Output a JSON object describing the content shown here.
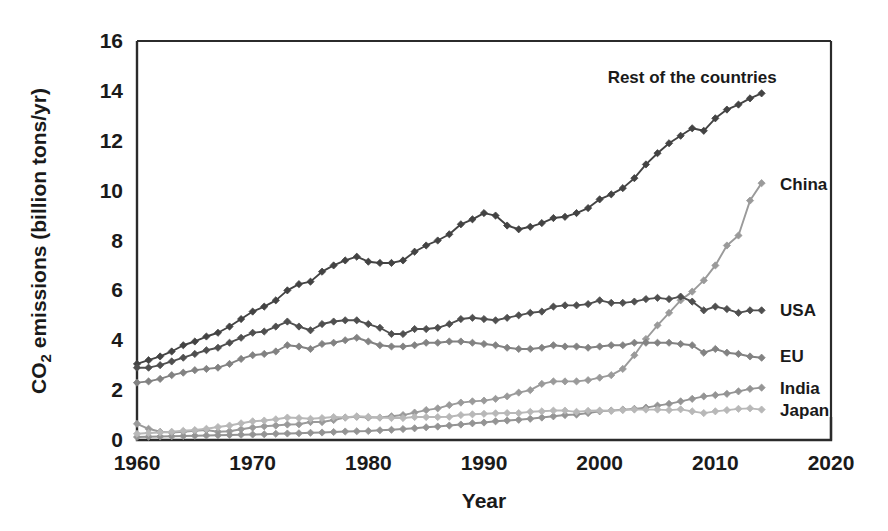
{
  "chart_data": {
    "type": "line",
    "title": "",
    "xlabel": "Year",
    "ylabel": "CO2 emissions (billion tons/yr)",
    "ylabel_parts": {
      "pre": "CO",
      "sub": "2",
      "post": " emissions (billion tons/yr)"
    },
    "xlim": [
      1960,
      2020
    ],
    "ylim": [
      0,
      16
    ],
    "xticks": [
      1960,
      1970,
      1980,
      1990,
      2000,
      2010,
      2020
    ],
    "xtick_labels": [
      "1960",
      "1970",
      "1980",
      "1990",
      "2000",
      "2010",
      "2020"
    ],
    "yticks": [
      0,
      2,
      4,
      6,
      8,
      10,
      12,
      14,
      16
    ],
    "ytick_labels": [
      "0",
      "2",
      "4",
      "6",
      "8",
      "10",
      "12",
      "14",
      "16"
    ],
    "grid": false,
    "legend_position": "right-inline-labels",
    "markers": "diamond",
    "x": [
      1960,
      1961,
      1962,
      1963,
      1964,
      1965,
      1966,
      1967,
      1968,
      1969,
      1970,
      1971,
      1972,
      1973,
      1974,
      1975,
      1976,
      1977,
      1978,
      1979,
      1980,
      1981,
      1982,
      1983,
      1984,
      1985,
      1986,
      1987,
      1988,
      1989,
      1990,
      1991,
      1992,
      1993,
      1994,
      1995,
      1996,
      1997,
      1998,
      1999,
      2000,
      2001,
      2002,
      2003,
      2004,
      2005,
      2006,
      2007,
      2008,
      2009,
      2010,
      2011,
      2012,
      2013,
      2014
    ],
    "series": [
      {
        "name": "Rest of the countries",
        "color": "#434343",
        "label_x": 2008,
        "label_y": 14.55,
        "label_anchor": "middle",
        "values": [
          3.05,
          3.2,
          3.35,
          3.55,
          3.8,
          3.95,
          4.15,
          4.3,
          4.55,
          4.85,
          5.15,
          5.35,
          5.6,
          6.0,
          6.25,
          6.35,
          6.75,
          7.0,
          7.2,
          7.35,
          7.15,
          7.1,
          7.1,
          7.2,
          7.55,
          7.8,
          8.0,
          8.25,
          8.65,
          8.85,
          9.1,
          9.0,
          8.6,
          8.45,
          8.55,
          8.7,
          8.9,
          8.95,
          9.1,
          9.3,
          9.65,
          9.85,
          10.1,
          10.5,
          11.05,
          11.5,
          11.9,
          12.2,
          12.5,
          12.4,
          12.9,
          13.25,
          13.45,
          13.7,
          13.9
        ]
      },
      {
        "name": "China",
        "color": "#9a9a9a",
        "label_x": 2015.6,
        "label_y": 10.25,
        "label_anchor": "start",
        "values": [
          0.65,
          0.45,
          0.33,
          0.3,
          0.33,
          0.37,
          0.4,
          0.33,
          0.35,
          0.43,
          0.5,
          0.55,
          0.58,
          0.62,
          0.63,
          0.72,
          0.72,
          0.8,
          0.9,
          0.93,
          0.9,
          0.9,
          0.95,
          1.0,
          1.1,
          1.2,
          1.27,
          1.4,
          1.5,
          1.55,
          1.58,
          1.65,
          1.75,
          1.9,
          2.0,
          2.25,
          2.35,
          2.35,
          2.35,
          2.4,
          2.5,
          2.6,
          2.85,
          3.4,
          4.05,
          4.6,
          5.1,
          5.6,
          5.95,
          6.4,
          7.0,
          7.8,
          8.2,
          9.6,
          10.3
        ]
      },
      {
        "name": "USA",
        "color": "#4f4f4f",
        "label_x": 2015.6,
        "label_y": 5.2,
        "label_anchor": "start",
        "values": [
          2.9,
          2.9,
          3.0,
          3.15,
          3.3,
          3.45,
          3.6,
          3.7,
          3.9,
          4.1,
          4.3,
          4.35,
          4.55,
          4.75,
          4.55,
          4.4,
          4.65,
          4.75,
          4.8,
          4.8,
          4.65,
          4.5,
          4.25,
          4.25,
          4.45,
          4.45,
          4.5,
          4.65,
          4.85,
          4.9,
          4.85,
          4.8,
          4.9,
          5.0,
          5.1,
          5.15,
          5.35,
          5.4,
          5.4,
          5.45,
          5.6,
          5.5,
          5.5,
          5.55,
          5.65,
          5.7,
          5.65,
          5.75,
          5.55,
          5.2,
          5.35,
          5.25,
          5.1,
          5.2,
          5.2
        ]
      },
      {
        "name": "EU",
        "color": "#828282",
        "label_x": 2015.6,
        "label_y": 3.35,
        "label_anchor": "start",
        "values": [
          2.3,
          2.35,
          2.45,
          2.6,
          2.7,
          2.8,
          2.85,
          2.9,
          3.05,
          3.25,
          3.4,
          3.45,
          3.55,
          3.8,
          3.75,
          3.65,
          3.85,
          3.9,
          4.0,
          4.1,
          3.95,
          3.8,
          3.75,
          3.75,
          3.8,
          3.9,
          3.9,
          3.95,
          3.95,
          3.9,
          3.85,
          3.8,
          3.7,
          3.65,
          3.65,
          3.7,
          3.8,
          3.75,
          3.75,
          3.7,
          3.75,
          3.8,
          3.8,
          3.9,
          3.9,
          3.9,
          3.9,
          3.85,
          3.8,
          3.5,
          3.65,
          3.5,
          3.45,
          3.35,
          3.3
        ]
      },
      {
        "name": "India",
        "color": "#949494",
        "label_x": 2015.6,
        "label_y": 2.1,
        "label_anchor": "start",
        "values": [
          0.12,
          0.13,
          0.14,
          0.15,
          0.16,
          0.17,
          0.18,
          0.19,
          0.2,
          0.21,
          0.22,
          0.23,
          0.25,
          0.26,
          0.27,
          0.29,
          0.3,
          0.32,
          0.34,
          0.35,
          0.36,
          0.39,
          0.41,
          0.44,
          0.47,
          0.51,
          0.54,
          0.58,
          0.62,
          0.67,
          0.7,
          0.75,
          0.78,
          0.81,
          0.85,
          0.9,
          0.95,
          1.0,
          1.02,
          1.08,
          1.15,
          1.18,
          1.22,
          1.25,
          1.3,
          1.38,
          1.45,
          1.55,
          1.65,
          1.75,
          1.8,
          1.85,
          1.95,
          2.05,
          2.1
        ]
      },
      {
        "name": "Japan",
        "color": "#b8b8b8",
        "label_x": 2015.6,
        "label_y": 1.22,
        "label_anchor": "start",
        "values": [
          0.25,
          0.28,
          0.3,
          0.33,
          0.37,
          0.4,
          0.45,
          0.52,
          0.58,
          0.67,
          0.75,
          0.78,
          0.83,
          0.9,
          0.88,
          0.85,
          0.88,
          0.92,
          0.9,
          0.95,
          0.93,
          0.9,
          0.88,
          0.88,
          0.92,
          0.92,
          0.92,
          0.93,
          1.0,
          1.03,
          1.05,
          1.07,
          1.08,
          1.08,
          1.13,
          1.15,
          1.18,
          1.18,
          1.13,
          1.17,
          1.18,
          1.17,
          1.2,
          1.22,
          1.22,
          1.22,
          1.2,
          1.23,
          1.15,
          1.08,
          1.15,
          1.2,
          1.25,
          1.27,
          1.22
        ]
      }
    ]
  },
  "axes": {
    "x_title": "Year",
    "y_title_pre": "CO",
    "y_title_sub": "2",
    "y_title_post": " emissions (billion tons/yr)"
  }
}
